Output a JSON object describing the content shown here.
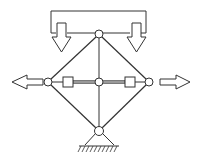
{
  "diagram": {
    "type": "mechanism-schematic",
    "colors": {
      "line": "#333333",
      "fill": "#ffffff",
      "bar": "#888888"
    },
    "nodes": [
      {
        "id": "top",
        "x": 99,
        "y": 34
      },
      {
        "id": "left",
        "x": 48,
        "y": 82
      },
      {
        "id": "center",
        "x": 99,
        "y": 82
      },
      {
        "id": "right",
        "x": 149,
        "y": 82
      },
      {
        "id": "bottom",
        "x": 99,
        "y": 131
      }
    ],
    "sliders": [
      {
        "id": "left-slider",
        "x": 68,
        "y": 82
      },
      {
        "id": "right-slider",
        "x": 130,
        "y": 82
      }
    ],
    "arrows": [
      {
        "id": "down-left",
        "direction": "down"
      },
      {
        "id": "down-right",
        "direction": "down"
      },
      {
        "id": "out-left",
        "direction": "left"
      },
      {
        "id": "out-right",
        "direction": "right"
      }
    ],
    "support": {
      "type": "pin",
      "ground": "hatched"
    }
  }
}
